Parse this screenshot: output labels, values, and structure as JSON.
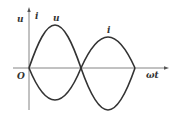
{
  "diagram": {
    "title": "",
    "labels": {
      "y_axis_u": "u",
      "y_axis_i": "i",
      "curve_u": "u",
      "curve_i": "i",
      "origin": "O",
      "x_axis": "ωt"
    },
    "colors": {
      "curve": "#333333",
      "axis": "#555555",
      "background": "#ffffff"
    }
  }
}
